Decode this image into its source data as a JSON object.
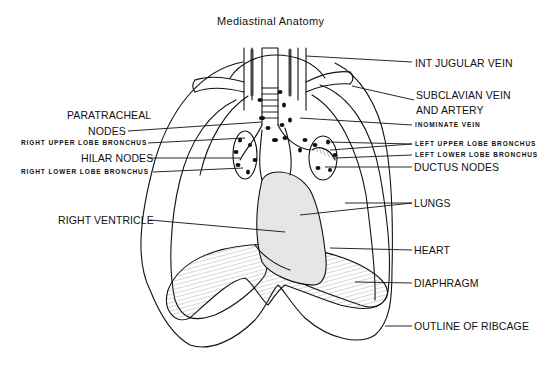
{
  "title": "Mediastinal Anatomy",
  "labels_left": {
    "paratracheal_line1": "PARATRACHEAL",
    "paratracheal_line2": "NODES",
    "right_upper_lobe_bronchus": "RIGHT UPPER LOBE BRONCHUS",
    "hilar_nodes": "HILAR NODES",
    "right_lower_lobe_bronchus": "RIGHT LOWER LOBE BRONCHUS",
    "right_ventricle": "RIGHT VENTRICLE"
  },
  "labels_right": {
    "int_jugular_vein": "INT JUGULAR VEIN",
    "subclavian_line1": "SUBCLAVIAN VEIN",
    "subclavian_line2": "AND ARTERY",
    "inominate_vein": "INOMINATE VEIN",
    "left_upper_lobe_bronchus": "LEFT UPPER LOBE BRONCHUS",
    "left_lower_lobe_bronchus": "LEFT LOWER LOBE BRONCHUS",
    "ductus_nodes": "DUCTUS NODES",
    "lungs": "LUNGS",
    "heart": "HEART",
    "diaphragm": "DIAPHRAGM",
    "outline_of_ribcage": "OUTLINE OF RIBCAGE"
  },
  "colors": {
    "ink": "#111111",
    "heart_fill": "#e6e6e6",
    "background": "#ffffff"
  }
}
